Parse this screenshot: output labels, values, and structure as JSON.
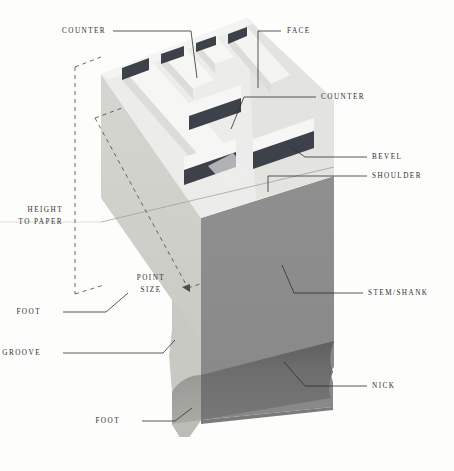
{
  "figure": {
    "kind": "letterpress-type-anatomy-diagram",
    "background_color": "#fdfdfc"
  },
  "colors": {
    "counter_dark": "#3d414a",
    "face_light": "#f2f2f0",
    "top_bevel": "#e4e4e1",
    "left_face": "#d2d2cd",
    "left_face_shadow": "#c4c4bf",
    "right_face": "#8c8c8c",
    "nick_dark": "#6e6e6e",
    "shoulder": "#e9e9e6",
    "leader_line": "#2f2f2f",
    "dash_line": "#555555",
    "text": "#2c2c2c"
  },
  "labels": [
    {
      "id": "counter-top",
      "text": "COUNTER",
      "align": "left",
      "x": 62,
      "y": 31
    },
    {
      "id": "face",
      "text": "FACE",
      "align": "left",
      "x": 287,
      "y": 31
    },
    {
      "id": "counter-mid",
      "text": "COUNTER",
      "align": "left",
      "x": 321,
      "y": 97
    },
    {
      "id": "bevel",
      "text": "BEVEL",
      "align": "left",
      "x": 372,
      "y": 157
    },
    {
      "id": "shoulder",
      "text": "SHOULDER",
      "align": "left",
      "x": 372,
      "y": 176
    },
    {
      "id": "stem-shank",
      "text": "STEM/SHANK",
      "align": "left",
      "x": 368,
      "y": 293
    },
    {
      "id": "nick",
      "text": "NICK",
      "align": "left",
      "x": 372,
      "y": 386
    },
    {
      "id": "foot-upper",
      "text": "FOOT",
      "align": "right",
      "x": 41,
      "y": 312
    },
    {
      "id": "groove",
      "text": "GROOVE",
      "align": "right",
      "x": 41,
      "y": 353
    },
    {
      "id": "foot-lower",
      "text": "FOOT",
      "align": "right",
      "x": 120,
      "y": 421
    }
  ],
  "measure_labels": [
    {
      "id": "height-to-paper",
      "line1": "HEIGHT",
      "line2": "TO PAPER",
      "align": "right",
      "x": 29,
      "y": 210
    },
    {
      "id": "point-size",
      "line1": "POINT",
      "line2": "SIZE",
      "align": "center",
      "x": 150,
      "y": 272
    }
  ]
}
